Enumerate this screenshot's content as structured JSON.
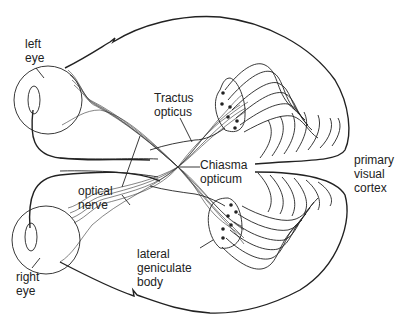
{
  "diagram": {
    "labels": {
      "left_eye": "left\neye",
      "right_eye": "right\neye",
      "tractus_opticus": "Tractus\nopticus",
      "chiasma_opticum": "Chiasma\nopticum",
      "optical_nerve": "optical\nnerve",
      "lateral_geniculate_body": "lateral\ngeniculate\nbody",
      "primary_visual_cortex": "primary\nvisual\ncortex"
    },
    "colors": {
      "stroke": "#222222",
      "background": "#ffffff",
      "text": "#222222"
    }
  }
}
